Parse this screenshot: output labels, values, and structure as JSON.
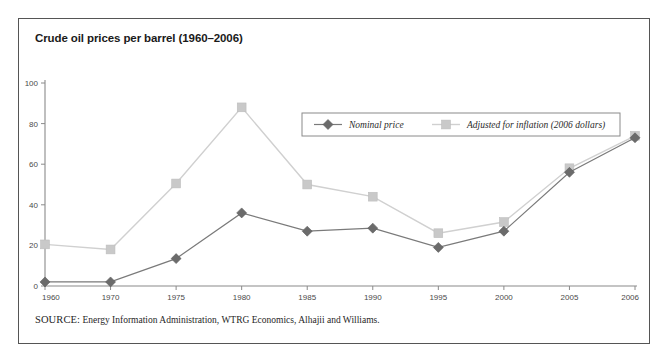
{
  "figure": {
    "title": "Crude oil prices per barrel (1960–2006)",
    "source_label": "SOURCE:",
    "source_text": " Energy Information Administration, WTRG Economics, Alhajii and Williams."
  },
  "colors": {
    "nominal": "#6b6b6b",
    "nominal_line": "#7a7a7a",
    "adjusted": "#c9c9c9",
    "adjusted_line": "#d0d0d0",
    "axis": "#8a8a8a",
    "frame": "#555555",
    "text": "#1a1a1a",
    "tick_text": "#4a4a4a"
  },
  "chart_data": {
    "type": "line",
    "title": "Crude oil prices per barrel (1960–2006)",
    "xlabel": "",
    "ylabel": "",
    "ylim": [
      0,
      100
    ],
    "yticks": [
      0,
      20,
      40,
      60,
      80,
      100
    ],
    "grid": false,
    "legend_position": "top-center",
    "categories": [
      "1960",
      "1970",
      "1975",
      "1980",
      "1985",
      "1990",
      "1995",
      "2000",
      "2005",
      "2006"
    ],
    "series": [
      {
        "name": "Nominal price",
        "marker": "diamond",
        "color": "#6b6b6b",
        "values": [
          2,
          2,
          13.5,
          36,
          27,
          28.5,
          19,
          27,
          56,
          73
        ]
      },
      {
        "name": "Adjusted for inflation (2006 dollars)",
        "marker": "square",
        "color": "#c9c9c9",
        "values": [
          20.5,
          18,
          50.5,
          88,
          50,
          44,
          26,
          31.5,
          58,
          74
        ]
      }
    ]
  }
}
